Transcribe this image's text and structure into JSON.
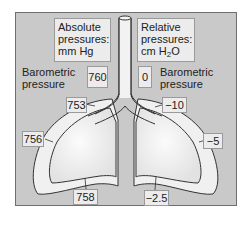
{
  "title_left": {
    "line1": "Absolute",
    "line2": "pressures:",
    "line3": "mm Hg"
  },
  "title_right": {
    "line1": "Relative",
    "line2": "pressures:",
    "line3_prefix": "cm H",
    "line3_sub": "2",
    "line3_suffix": "O"
  },
  "barometric": {
    "label_left_1": "Barometric",
    "label_left_2": "pressure",
    "label_right_1": "Barometric",
    "label_right_2": "pressure",
    "absolute": "760",
    "relative": "0"
  },
  "absolute_values": {
    "alveolar_upper": "753",
    "pleural_side": "756",
    "pleural_base": "758"
  },
  "relative_values": {
    "alveolar_upper": "−10",
    "pleural_side": "−5",
    "pleural_base": "−2.5"
  },
  "colors": {
    "background": "#c9c9c9",
    "lung_fill": "#eeeeee",
    "outline": "#333333",
    "box": "#ececec"
  }
}
